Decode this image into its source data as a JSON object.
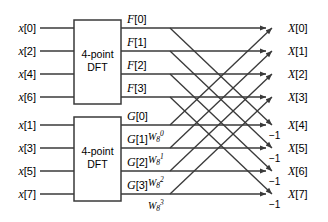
{
  "diagram": {
    "type": "signal-flow-graph",
    "stroke_color": "#3a3a3a",
    "text_color": "#000000",
    "background": "#ffffff"
  },
  "inputs": [
    {
      "label": "x[0]",
      "row": 0,
      "y": 28
    },
    {
      "label": "x[2]",
      "row": 1,
      "y": 51
    },
    {
      "label": "x[4]",
      "row": 2,
      "y": 74
    },
    {
      "label": "x[6]",
      "row": 3,
      "y": 97
    },
    {
      "label": "x[1]",
      "row": 4,
      "y": 125
    },
    {
      "label": "x[3]",
      "row": 5,
      "y": 148
    },
    {
      "label": "x[5]",
      "row": 6,
      "y": 171
    },
    {
      "label": "x[7]",
      "row": 7,
      "y": 194
    }
  ],
  "blocks": [
    {
      "name": "top-dft",
      "line1": "4-point",
      "line2": "DFT",
      "x": 74,
      "y": 20,
      "w": 47,
      "h": 84
    },
    {
      "name": "bottom-dft",
      "line1": "4-point",
      "line2": "DFT",
      "x": 74,
      "y": 117,
      "w": 47,
      "h": 84
    }
  ],
  "intermediate": [
    {
      "label": "F[0]",
      "row": 0,
      "y": 28
    },
    {
      "label": "F[1]",
      "row": 1,
      "y": 51
    },
    {
      "label": "F[2]",
      "row": 2,
      "y": 74
    },
    {
      "label": "F[3]",
      "row": 3,
      "y": 97
    },
    {
      "label": "G[0]",
      "row": 4,
      "y": 125
    },
    {
      "label": "G[1]",
      "row": 5,
      "y": 148
    },
    {
      "label": "G[2]",
      "row": 6,
      "y": 171
    },
    {
      "label": "G[3]",
      "row": 7,
      "y": 194
    }
  ],
  "twiddles": [
    {
      "base": "W",
      "sub": "8",
      "sup": "0",
      "row": 4,
      "x": 148,
      "y": 130
    },
    {
      "base": "W",
      "sub": "8",
      "sup": "1",
      "row": 5,
      "x": 148,
      "y": 153
    },
    {
      "base": "W",
      "sub": "8",
      "sup": "2",
      "row": 6,
      "x": 148,
      "y": 176
    },
    {
      "base": "W",
      "sub": "8",
      "sup": "3",
      "row": 7,
      "x": 148,
      "y": 199
    }
  ],
  "negations": [
    {
      "label": "-1",
      "row": 4,
      "x": 269,
      "y": 131
    },
    {
      "label": "-1",
      "row": 5,
      "x": 269,
      "y": 154
    },
    {
      "label": "-1",
      "row": 6,
      "x": 269,
      "y": 177
    },
    {
      "label": "-1",
      "row": 7,
      "x": 269,
      "y": 200
    }
  ],
  "outputs": [
    {
      "label": "X[0]",
      "row": 0,
      "y": 28
    },
    {
      "label": "X[1]",
      "row": 1,
      "y": 51
    },
    {
      "label": "X[2]",
      "row": 2,
      "y": 74
    },
    {
      "label": "X[3]",
      "row": 3,
      "y": 97
    },
    {
      "label": "X[4]",
      "row": 4,
      "y": 125
    },
    {
      "label": "X[5]",
      "row": 5,
      "y": 148
    },
    {
      "label": "X[6]",
      "row": 6,
      "y": 171
    },
    {
      "label": "X[7]",
      "row": 7,
      "y": 194
    }
  ],
  "geometry": {
    "rows_y": [
      28,
      51,
      74,
      97,
      125,
      148,
      171,
      194
    ],
    "input_line_x1": 40,
    "input_line_x2": 74,
    "box_right_x": 121,
    "horiz_line_x2": 266,
    "diag_x1": 170,
    "diag_x2": 272,
    "output_label_x": 288
  }
}
